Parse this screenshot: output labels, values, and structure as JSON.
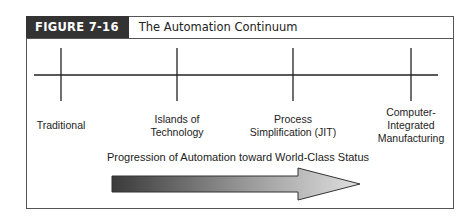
{
  "figure": {
    "label": "FIGURE 7-16",
    "title": "The Automation Continuum"
  },
  "stages": [
    {
      "label": "Traditional",
      "lines": [
        "Traditional"
      ]
    },
    {
      "label": "Islands of Technology",
      "lines": [
        "Islands of",
        "Technology"
      ]
    },
    {
      "label": "Process Simplification (JIT)",
      "lines": [
        "Process",
        "Simplification (JIT)"
      ]
    },
    {
      "label": "Computer-Integrated Manufacturing",
      "lines": [
        "Computer-",
        "Integrated",
        "Manufacturing"
      ]
    }
  ],
  "arrow": {
    "caption": "Progression of Automation toward World-Class Status",
    "gradient_start": "#3a3a3a",
    "gradient_end": "#dcdcdc"
  },
  "colors": {
    "header_bg": "#333333",
    "line": "#222222",
    "border": "#555555"
  }
}
